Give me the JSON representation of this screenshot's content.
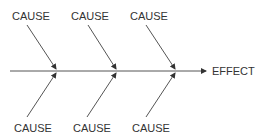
{
  "diagram": {
    "type": "fishbone",
    "effect_label": "EFFECT",
    "causes_top": [
      {
        "label": "CAUSE",
        "x": 12,
        "y": 10
      },
      {
        "label": "CAUSE",
        "x": 71,
        "y": 10
      },
      {
        "label": "CAUSE",
        "x": 130,
        "y": 10
      }
    ],
    "causes_bottom": [
      {
        "label": "CAUSE",
        "x": 14,
        "y": 122
      },
      {
        "label": "CAUSE",
        "x": 73,
        "y": 122
      },
      {
        "label": "CAUSE",
        "x": 132,
        "y": 122
      }
    ],
    "line_color": "#444444"
  }
}
